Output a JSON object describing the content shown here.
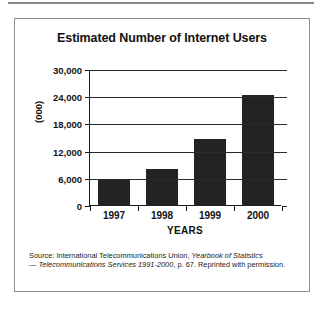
{
  "figure": {
    "title": "Estimated Number of Internet Users",
    "source_prefix": "Source: International Telecommunications Union,  ",
    "source_italic_1": "Yearbook of Statistics",
    "source_dash": "— ",
    "source_italic_2": "Telecommunications Services 1991-2000",
    "source_suffix": ", p. 67. Reprinted with permission."
  },
  "chart_data": {
    "type": "bar",
    "title": "Estimated Number of Internet Users",
    "xlabel": "YEARS",
    "ylabel": "(000)",
    "categories": [
      "1997",
      "1998",
      "1999",
      "2000"
    ],
    "values": [
      5800,
      8200,
      14800,
      24500
    ],
    "ylim": [
      0,
      30000
    ],
    "yticks": [
      0,
      6000,
      12000,
      18000,
      24000,
      30000
    ],
    "ytick_labels": [
      "0",
      "6,000",
      "12,000",
      "18,000",
      "24,000",
      "30,000"
    ],
    "grid": true,
    "legend": false,
    "bar_color": "#232323",
    "axis_color": "#1a1a1a"
  }
}
